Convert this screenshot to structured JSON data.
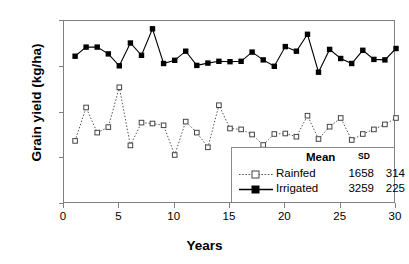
{
  "chart_data": {
    "type": "line",
    "title": "",
    "xlabel": "Years",
    "ylabel": "Grain yield (kg/ha)",
    "xlim": [
      0,
      30
    ],
    "ylim": [
      0,
      4000
    ],
    "xticks": [
      0,
      5,
      10,
      15,
      20,
      25,
      30
    ],
    "yticks": [
      0,
      1000,
      2000,
      3000,
      4000
    ],
    "grid": false,
    "legend_position": "lower-right",
    "x": [
      1,
      2,
      3,
      4,
      5,
      6,
      7,
      8,
      9,
      10,
      11,
      12,
      13,
      14,
      15,
      16,
      17,
      18,
      19,
      20,
      21,
      22,
      23,
      24,
      25,
      26,
      27,
      28,
      29,
      30
    ],
    "series": [
      {
        "name": "Rainfed",
        "marker": "open-square",
        "line_style": "dotted",
        "color": "#555555",
        "mean": 1658,
        "sd": 314,
        "values": [
          1380,
          2110,
          1560,
          1680,
          2550,
          1280,
          1780,
          1760,
          1720,
          1070,
          1800,
          1560,
          1240,
          2160,
          1650,
          1630,
          1520,
          1290,
          1530,
          1540,
          1470,
          1930,
          1420,
          1690,
          1880,
          1400,
          1530,
          1630,
          1740,
          1880
        ]
      },
      {
        "name": "Irrigated",
        "marker": "filled-square",
        "line_style": "solid",
        "color": "#000000",
        "mean": 3259,
        "sd": 225,
        "values": [
          3230,
          3430,
          3430,
          3280,
          3020,
          3520,
          3250,
          3830,
          3070,
          3140,
          3340,
          3030,
          3080,
          3120,
          3110,
          3120,
          3320,
          3150,
          3010,
          3440,
          3340,
          3710,
          2880,
          3380,
          3180,
          3070,
          3360,
          3160,
          3150,
          3400
        ]
      }
    ]
  },
  "legend": {
    "mean_header": "Mean",
    "sd_header": "SD"
  }
}
